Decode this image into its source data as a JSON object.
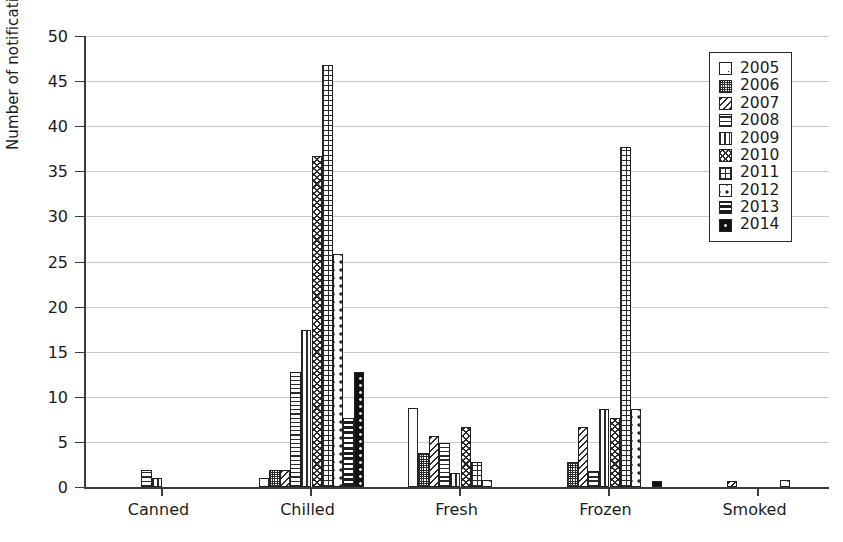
{
  "chart_data": {
    "type": "bar",
    "title": "",
    "subtitle": "",
    "xlabel": "",
    "ylabel": "Number of notifications",
    "categories": [
      "Canned",
      "Chilled",
      "Fresh",
      "Frozen",
      "Smoked"
    ],
    "ylim": [
      0,
      50
    ],
    "yticks": [
      0,
      5,
      10,
      15,
      20,
      25,
      30,
      35,
      40,
      45,
      50
    ],
    "grid": "horizontal",
    "legend_position": "top-right",
    "legend_entries": [
      "2005",
      "2006",
      "2007",
      "2008",
      "2009",
      "2010",
      "2011",
      "2012",
      "2013",
      "2014"
    ],
    "series": [
      {
        "name": "2005",
        "pattern": "open-center-dot",
        "values": [
          0,
          1.0,
          8.8,
          0,
          0
        ]
      },
      {
        "name": "2006",
        "pattern": "fine-checker",
        "values": [
          0,
          1.9,
          3.8,
          2.8,
          0
        ]
      },
      {
        "name": "2007",
        "pattern": "diagonal-hatch",
        "values": [
          0,
          1.9,
          5.7,
          6.7,
          0.7
        ]
      },
      {
        "name": "2008",
        "pattern": "horizontal-lines",
        "values": [
          1.9,
          12.8,
          4.9,
          1.8,
          0
        ]
      },
      {
        "name": "2009",
        "pattern": "vertical-lines",
        "values": [
          1.0,
          17.4,
          1.6,
          8.6,
          0
        ]
      },
      {
        "name": "2010",
        "pattern": "wavy-scales",
        "values": [
          0,
          36.7,
          6.7,
          7.7,
          0
        ]
      },
      {
        "name": "2011",
        "pattern": "fine-grid",
        "values": [
          0,
          46.8,
          2.8,
          37.7,
          0
        ]
      },
      {
        "name": "2012",
        "pattern": "sparse-dots",
        "values": [
          0,
          25.8,
          0.8,
          8.7,
          0.8
        ]
      },
      {
        "name": "2013",
        "pattern": "thick-bands",
        "values": [
          0,
          7.6,
          0,
          0,
          0
        ]
      },
      {
        "name": "2014",
        "pattern": "solid-dark-dots",
        "values": [
          0,
          12.8,
          0,
          0.7,
          0
        ]
      }
    ]
  }
}
